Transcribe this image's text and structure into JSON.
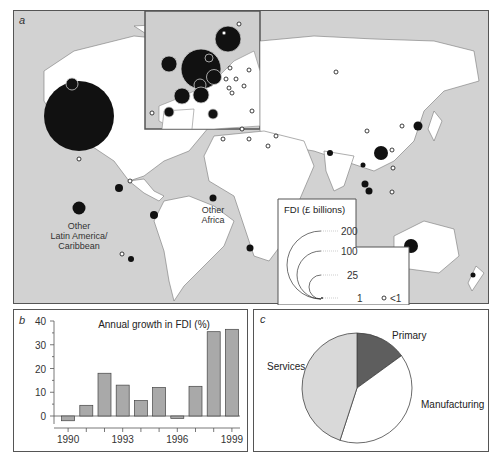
{
  "figure": {
    "panel_a_label": "a",
    "panel_b_label": "b",
    "panel_c_label": "c"
  },
  "map": {
    "region_labels": {
      "other_latin_america": [
        "Other",
        "Latin America/",
        "Caribbean"
      ],
      "other_africa": [
        "Other",
        "Africa"
      ]
    },
    "legend": {
      "title": "FDI (£ billions)",
      "levels": [
        "200",
        "100",
        "25",
        "1"
      ],
      "small_symbol_label": "<1"
    },
    "colors": {
      "land": "#ffffff",
      "sea": "#d2d2d2",
      "bubble": "#111111"
    }
  },
  "chart_data": [
    {
      "type": "bar",
      "title": "Annual growth in FDI (%)",
      "categories": [
        "1990",
        "1991",
        "1992",
        "1993",
        "1994",
        "1995",
        "1996",
        "1997",
        "1998",
        "1999"
      ],
      "values": [
        -2,
        4.5,
        18,
        13,
        6.5,
        12,
        -1,
        12.5,
        35.5,
        36.5
      ],
      "xtick_labels": [
        "1990",
        "1993",
        "1996",
        "1999"
      ],
      "ytick_labels": [
        "0",
        "10",
        "20",
        "30",
        "40"
      ],
      "xlabel": "",
      "ylabel": "",
      "ylim": [
        -5,
        40
      ],
      "grid": false,
      "bar_color": "#a9a9a9"
    },
    {
      "type": "pie",
      "title": "",
      "labels": [
        "Primary",
        "Manufacturing",
        "Services"
      ],
      "values": [
        15,
        40,
        45
      ],
      "colors": [
        "#5e5e5e",
        "#ffffff",
        "#d9d9d9"
      ]
    }
  ]
}
